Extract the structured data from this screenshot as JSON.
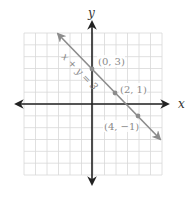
{
  "chart_data": {
    "type": "line",
    "title": "",
    "xlabel": "x",
    "ylabel": "y",
    "xlim": [
      -6,
      6
    ],
    "ylim": [
      -6,
      6
    ],
    "grid": true,
    "series": [
      {
        "name": "x + y = 3",
        "equation": "x + y = 3",
        "x": [
          -3,
          7
        ],
        "y": [
          6,
          -4
        ],
        "color": "#8c8c8c"
      }
    ],
    "points": [
      {
        "x": 0,
        "y": 3,
        "label": "(0, 3)"
      },
      {
        "x": 2,
        "y": 1,
        "label": "(2, 1)"
      },
      {
        "x": 4,
        "y": -1,
        "label": "(4, −1)"
      }
    ],
    "annotations": [
      "x + y = 3"
    ]
  },
  "labels": {
    "x_axis": "x",
    "y_axis": "y",
    "line_label": "x + y = 3",
    "p1": "(0, 3)",
    "p2": "(2, 1)",
    "p3": "(4, −1)"
  },
  "colors": {
    "grid": "#d8d8d8",
    "axis": "#222222",
    "line": "#8c8c8c",
    "point": "#8c8c8c",
    "text": "#8a8a8a"
  }
}
